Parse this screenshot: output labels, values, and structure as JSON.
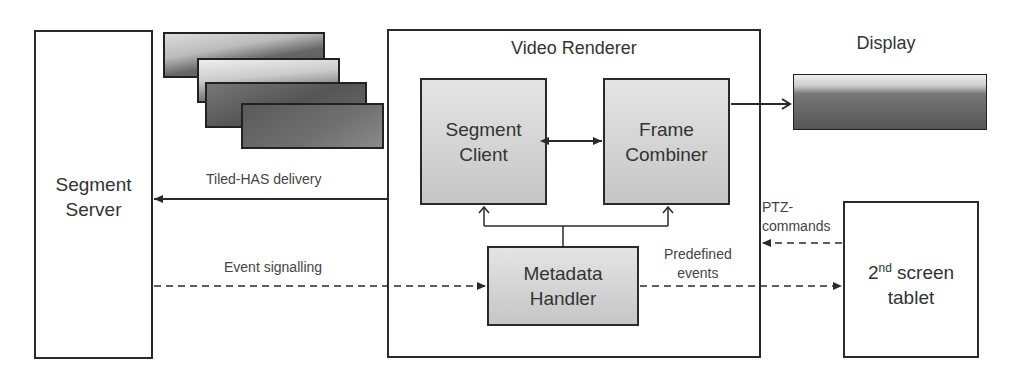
{
  "diagram": {
    "nodes": {
      "segment_server": {
        "line1": "Segment",
        "line2": "Server"
      },
      "video_renderer": {
        "title": "Video Renderer"
      },
      "segment_client": {
        "line1": "Segment",
        "line2": "Client"
      },
      "frame_combiner": {
        "line1": "Frame",
        "line2": "Combiner"
      },
      "metadata_handler": {
        "line1": "Metadata",
        "line2": "Handler"
      },
      "display": {
        "title": "Display"
      },
      "second_screen": {
        "num": "2",
        "sup": "nd",
        "rest": " screen",
        "line2": "tablet"
      }
    },
    "edges": {
      "tiled_has": "Tiled-HAS delivery",
      "event_signalling": "Event signalling",
      "predefined_line1": "Predefined",
      "predefined_line2": "events",
      "ptz_line1": "PTZ-",
      "ptz_line2": "commands"
    },
    "colors": {
      "stroke": "#2a2a2a",
      "component_fill_top": "#e4e4e4",
      "component_fill_bottom": "#c6c6c6"
    }
  }
}
